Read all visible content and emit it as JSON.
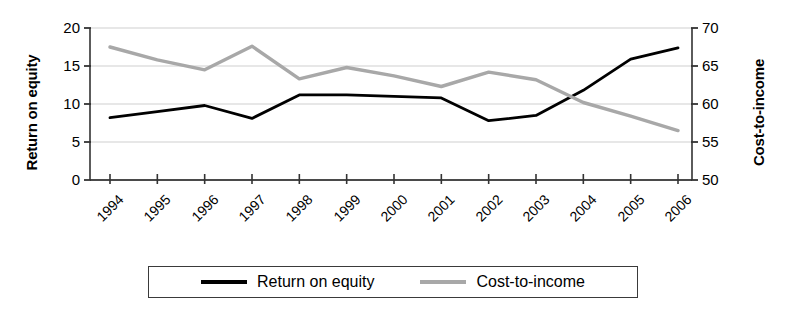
{
  "chart_data": {
    "type": "line",
    "title": "",
    "xlabel": "",
    "ylabel": "Return on equity",
    "y2label": "Cost-to-income",
    "categories": [
      "1994",
      "1995",
      "1996",
      "1997",
      "1998",
      "1999",
      "2000",
      "2001",
      "2002",
      "2003",
      "2004",
      "2005",
      "2006"
    ],
    "ylim": [
      0,
      20
    ],
    "y2lim": [
      50,
      70
    ],
    "yticks": [
      "0",
      "5",
      "10",
      "15",
      "20"
    ],
    "y2ticks": [
      "50",
      "55",
      "60",
      "65",
      "70"
    ],
    "grid": true,
    "legend_position": "bottom",
    "series": [
      {
        "name": "Return on equity",
        "axis": "left",
        "color": "#000000",
        "values": [
          8.2,
          9.0,
          9.8,
          8.1,
          11.2,
          11.2,
          11.0,
          10.8,
          7.8,
          8.5,
          11.8,
          15.9,
          17.4
        ]
      },
      {
        "name": "Cost-to-income",
        "axis": "right",
        "color": "#a8a8a8",
        "values": [
          67.5,
          65.8,
          64.5,
          67.6,
          63.3,
          64.8,
          63.7,
          62.3,
          64.2,
          63.2,
          60.2,
          58.4,
          56.5
        ]
      }
    ]
  },
  "axes": {
    "left_title": "Return on equity",
    "right_title": "Cost-to-income"
  },
  "legend": {
    "items": [
      {
        "label": "Return on equity",
        "swatch": "black-line-swatch"
      },
      {
        "label": "Cost-to-income",
        "swatch": "gray-line-swatch"
      }
    ]
  }
}
